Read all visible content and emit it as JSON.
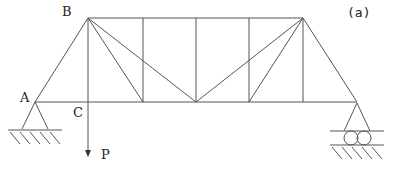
{
  "figure": {
    "tag": "(a)",
    "line_color": "#555555"
  },
  "labels": {
    "B": "B",
    "A": "A",
    "C": "C",
    "P": "P"
  },
  "truss": {
    "top_chord_nodes": [
      [
        88,
        18
      ],
      [
        143,
        18
      ],
      [
        196,
        18
      ],
      [
        249,
        18
      ],
      [
        303,
        18
      ]
    ],
    "bottom_chord_nodes": [
      [
        35,
        102
      ],
      [
        88,
        102
      ],
      [
        143,
        102
      ],
      [
        196,
        102
      ],
      [
        249,
        102
      ],
      [
        303,
        102
      ],
      [
        357,
        102
      ]
    ],
    "supports": {
      "left": "pin",
      "right": "roller"
    },
    "load": {
      "at": "C",
      "direction": "down"
    }
  }
}
